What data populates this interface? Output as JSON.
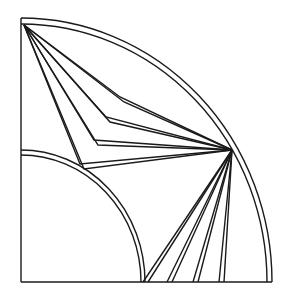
{
  "diagram": {
    "title": "",
    "background": "#ffffff",
    "stroke_color": "#1a1a1a",
    "stroke_width": 1.4,
    "frame": {
      "left_edge": {
        "x1": 21,
        "y1": 18,
        "x2": 21,
        "y2": 282
      },
      "bottom_edge": {
        "x1": 21,
        "y1": 282,
        "x2": 272,
        "y2": 282
      }
    },
    "arcs": [
      {
        "name": "outer-shell-outer",
        "d": "M21,18 A251,264 0 0 1 272,282"
      },
      {
        "name": "outer-shell-inner",
        "d": "M21,24 A246,258 0 0 1 267,282"
      },
      {
        "name": "core-outer",
        "d": "M21,150 A124,132 0 0 1 145,282"
      },
      {
        "name": "core-inner",
        "d": "M21,155 A120,127 0 0 1 141,282"
      }
    ],
    "apex_point": {
      "x": 24,
      "y": 25
    },
    "focus_point": {
      "x": 232,
      "y": 150
    },
    "bent_rays": [
      {
        "name": "ray-1a",
        "points": "24,25 120,97 232,150"
      },
      {
        "name": "ray-1b",
        "points": "24,25 124,102 232,150"
      },
      {
        "name": "ray-2a",
        "points": "24,25 106,117 232,150"
      },
      {
        "name": "ray-2b",
        "points": "24,25 110,122 232,150"
      },
      {
        "name": "ray-3a",
        "points": "24,25 94,140 232,150"
      },
      {
        "name": "ray-3b",
        "points": "24,25 98,145 232,150"
      },
      {
        "name": "ray-4a",
        "points": "24,25 80,164 232,150"
      },
      {
        "name": "ray-4b",
        "points": "24,25 84,169 232,150"
      }
    ],
    "fan_rays": [
      {
        "name": "fan-1a",
        "x1": 232,
        "y1": 150,
        "x2": 143,
        "y2": 282
      },
      {
        "name": "fan-1b",
        "x1": 232,
        "y1": 150,
        "x2": 148,
        "y2": 282
      },
      {
        "name": "fan-2a",
        "x1": 232,
        "y1": 150,
        "x2": 167,
        "y2": 282
      },
      {
        "name": "fan-2b",
        "x1": 232,
        "y1": 150,
        "x2": 172,
        "y2": 282
      },
      {
        "name": "fan-3a",
        "x1": 232,
        "y1": 150,
        "x2": 193,
        "y2": 282
      },
      {
        "name": "fan-3b",
        "x1": 232,
        "y1": 150,
        "x2": 198,
        "y2": 282
      },
      {
        "name": "fan-4a",
        "x1": 232,
        "y1": 150,
        "x2": 219,
        "y2": 282
      },
      {
        "name": "fan-4b",
        "x1": 232,
        "y1": 150,
        "x2": 224,
        "y2": 282
      }
    ]
  }
}
